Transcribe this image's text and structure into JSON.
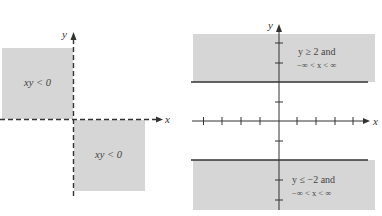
{
  "colors": {
    "shade": "#d6d6d6",
    "axis": "#333333",
    "text": "#444444"
  },
  "left_figure": {
    "axis_x_label": "x",
    "axis_y_label": "y",
    "axis_style": "dashed",
    "regions": [
      {
        "quadrant": "II",
        "label": "xy < 0"
      },
      {
        "quadrant": "IV",
        "label": "xy < 0"
      }
    ]
  },
  "right_figure": {
    "axis_x_label": "x",
    "axis_y_label": "y",
    "boundary_lines": [
      "y = 2",
      "y = -2"
    ],
    "regions": [
      {
        "position": "top",
        "line1": "y ≥ 2 and",
        "line2": "−∞ < x < ∞"
      },
      {
        "position": "bottom",
        "line1": "y ≤ −2 and",
        "line2": "−∞ < x < ∞"
      }
    ]
  }
}
